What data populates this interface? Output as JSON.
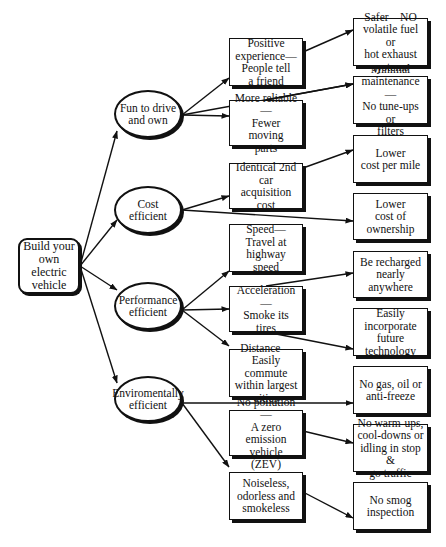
{
  "diagram": {
    "title": "Build your own electric vehicle",
    "nodes": [
      {
        "id": "root",
        "label": "Build your\nown electric\nvehicle",
        "shape": "root",
        "x": 18,
        "y": 238,
        "w": 62,
        "h": 56
      },
      {
        "id": "fun",
        "label": "Fun to drive\nand own",
        "shape": "ellipse",
        "x": 114,
        "y": 90,
        "w": 68,
        "h": 48
      },
      {
        "id": "cost",
        "label": "Cost\nefficient",
        "shape": "ellipse",
        "x": 114,
        "y": 186,
        "w": 68,
        "h": 48
      },
      {
        "id": "perf",
        "label": "Performance\nefficient",
        "shape": "ellipse",
        "x": 114,
        "y": 282,
        "w": 68,
        "h": 48
      },
      {
        "id": "env",
        "label": "Enviromentally\nefficient",
        "shape": "ellipse",
        "x": 114,
        "y": 376,
        "w": 68,
        "h": 46
      },
      {
        "id": "positive",
        "label": "Positive\nexperience—\nPeople tell\na friend",
        "shape": "box",
        "x": 229,
        "y": 38,
        "w": 74,
        "h": 48
      },
      {
        "id": "reliable",
        "label": "More reliable—\nFewer moving\nparts",
        "shape": "box",
        "x": 229,
        "y": 100,
        "w": 74,
        "h": 46
      },
      {
        "id": "identical",
        "label": "Identical 2nd\ncar acquisition\ncost",
        "shape": "box",
        "x": 229,
        "y": 163,
        "w": 74,
        "h": 46
      },
      {
        "id": "speed",
        "label": "Speed—\nTravel at\nhighway\nspeed",
        "shape": "box",
        "x": 229,
        "y": 224,
        "w": 74,
        "h": 48
      },
      {
        "id": "accel",
        "label": "Acceleration—\nSmoke its tires",
        "shape": "box",
        "x": 229,
        "y": 286,
        "w": 74,
        "h": 46
      },
      {
        "id": "distance",
        "label": "Distance—\nEasily commute\nwithin largest\ncities",
        "shape": "box",
        "x": 229,
        "y": 349,
        "w": 74,
        "h": 48
      },
      {
        "id": "nopollution",
        "label": "No pollution—\nA zero emission\nvehicle (ZEV)",
        "shape": "box",
        "x": 229,
        "y": 410,
        "w": 74,
        "h": 46
      },
      {
        "id": "noiseless",
        "label": "Noiseless,\nodorless and\nsmokeless",
        "shape": "box",
        "x": 229,
        "y": 472,
        "w": 74,
        "h": 48
      },
      {
        "id": "safer",
        "label": "Safer—NO\nvolatile fuel or\nhot exhaust\nsystems",
        "shape": "box",
        "x": 353,
        "y": 18,
        "w": 75,
        "h": 48
      },
      {
        "id": "maint",
        "label": "Minimal\nmaintenance—\nNo tune-ups or\nfilters",
        "shape": "box",
        "x": 353,
        "y": 76,
        "w": 75,
        "h": 48
      },
      {
        "id": "costmile",
        "label": "Lower\ncost per mile",
        "shape": "box",
        "x": 353,
        "y": 135,
        "w": 75,
        "h": 48
      },
      {
        "id": "ownership",
        "label": "Lower\ncost of\nownership",
        "shape": "box",
        "x": 353,
        "y": 193,
        "w": 75,
        "h": 47
      },
      {
        "id": "recharge",
        "label": "Be recharged\nnearly\nanywhere",
        "shape": "box",
        "x": 353,
        "y": 251,
        "w": 75,
        "h": 47
      },
      {
        "id": "future",
        "label": "Easily\nincorporate\nfuture\ntechnology",
        "shape": "box",
        "x": 353,
        "y": 308,
        "w": 75,
        "h": 48
      },
      {
        "id": "nogas",
        "label": "No gas, oil or\nanti-freeze",
        "shape": "box",
        "x": 353,
        "y": 366,
        "w": 75,
        "h": 48
      },
      {
        "id": "nowarm",
        "label": "No warm-ups,\ncool-downs or\nidling in stop &\ngo traffic",
        "shape": "box",
        "x": 353,
        "y": 424,
        "w": 75,
        "h": 48
      },
      {
        "id": "nosmog",
        "label": "No smog\ninspection",
        "shape": "box",
        "x": 353,
        "y": 482,
        "w": 75,
        "h": 48
      }
    ],
    "edges": [
      {
        "from": [
          80,
          266
        ],
        "to": [
          117,
          131
        ]
      },
      {
        "from": [
          80,
          266
        ],
        "to": [
          117,
          220
        ]
      },
      {
        "from": [
          80,
          266
        ],
        "to": [
          117,
          290
        ]
      },
      {
        "from": [
          80,
          266
        ],
        "to": [
          117,
          383
        ]
      },
      {
        "from": [
          182,
          115
        ],
        "to": [
          229,
          78
        ]
      },
      {
        "from": [
          182,
          115
        ],
        "to": [
          229,
          116
        ]
      },
      {
        "from": [
          182,
          115
        ],
        "to": [
          353,
          84
        ]
      },
      {
        "from": [
          182,
          210
        ],
        "to": [
          229,
          196
        ]
      },
      {
        "from": [
          182,
          210
        ],
        "to": [
          353,
          221
        ]
      },
      {
        "from": [
          182,
          310
        ],
        "to": [
          229,
          271
        ]
      },
      {
        "from": [
          182,
          310
        ],
        "to": [
          229,
          309
        ]
      },
      {
        "from": [
          182,
          310
        ],
        "to": [
          229,
          346
        ]
      },
      {
        "from": [
          182,
          403
        ],
        "to": [
          353,
          403
        ]
      },
      {
        "from": [
          182,
          403
        ],
        "to": [
          229,
          467
        ]
      },
      {
        "from": [
          303,
          52
        ],
        "to": [
          353,
          30
        ],
        "arrow": true
      },
      {
        "from": [
          266,
          100
        ],
        "to": [
          353,
          84
        ],
        "arrow": true,
        "note": "reliable-to-maint"
      },
      {
        "from": [
          303,
          168
        ],
        "to": [
          353,
          150
        ],
        "arrow": true
      },
      {
        "from": [
          266,
          286
        ],
        "to": [
          353,
          273
        ],
        "arrow": true
      },
      {
        "from": [
          266,
          332
        ],
        "to": [
          353,
          349
        ],
        "arrow": true
      },
      {
        "from": [
          303,
          431
        ],
        "to": [
          353,
          443
        ],
        "arrow": true
      },
      {
        "from": [
          303,
          492
        ],
        "to": [
          353,
          518
        ],
        "arrow": true
      }
    ]
  }
}
